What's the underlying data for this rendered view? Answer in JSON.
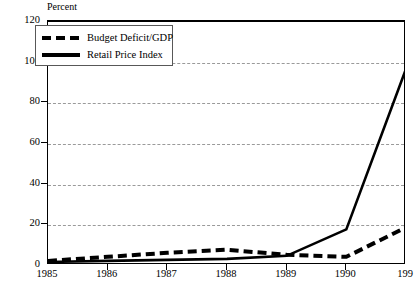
{
  "chart_data": {
    "type": "line",
    "title": "",
    "subtitle": "",
    "unit_label": "Percent",
    "xlabel": "",
    "ylabel": "Percent",
    "x": [
      1985,
      1986,
      1987,
      1988,
      1989,
      1990,
      1991
    ],
    "xtick_labels": [
      "1985",
      "1986",
      "1987",
      "1988",
      "1989",
      "1990",
      "199"
    ],
    "ytick_labels": [
      "0",
      "20",
      "40",
      "60",
      "80",
      "100",
      "120"
    ],
    "ytick_values": [
      0,
      20,
      40,
      60,
      80,
      100,
      120
    ],
    "ylim": [
      0,
      120
    ],
    "xlim": [
      1985,
      1991
    ],
    "grid": "horizontal-dashed",
    "legend_position": "top-left-inside",
    "series": [
      {
        "name": "Budget Deficit/GDP",
        "style": "dashed",
        "color": "#000000",
        "values": [
          2.5,
          4.5,
          6.5,
          8.0,
          5.5,
          4.5,
          19.0
        ]
      },
      {
        "name": "Retail Price Index",
        "style": "solid",
        "color": "#000000",
        "values": [
          2.0,
          2.5,
          3.0,
          3.5,
          5.0,
          18.0,
          97.0
        ]
      }
    ]
  },
  "footnote": ""
}
